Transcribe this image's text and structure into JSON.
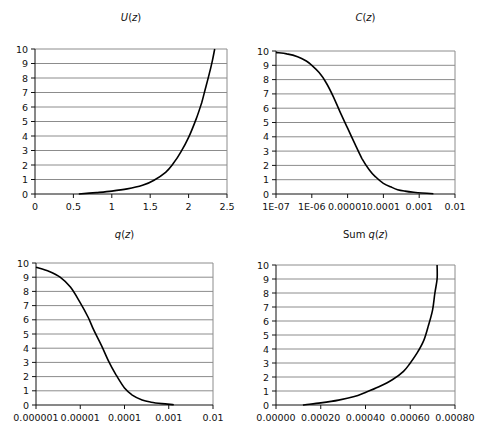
{
  "chart_data": [
    {
      "type": "line",
      "title": "U(z)",
      "title_parts": {
        "func": "U",
        "arg": "(z)"
      },
      "xlabel": "",
      "ylabel": "",
      "x_scale": "linear",
      "xlim": [
        0,
        2.5
      ],
      "ylim": [
        0,
        10
      ],
      "x_ticks": [
        "0",
        "0.5",
        "1",
        "1.5",
        "2",
        "2.5"
      ],
      "y_ticks": [
        "0",
        "1",
        "2",
        "3",
        "4",
        "5",
        "6",
        "7",
        "8",
        "9",
        "10"
      ],
      "grid": "horizontal",
      "legend": null,
      "series": [
        {
          "name": "U(z)",
          "x": [
            0.57,
            0.8,
            1.0,
            1.2,
            1.4,
            1.55,
            1.7,
            1.8,
            1.9,
            2.0,
            2.1,
            2.17,
            2.22,
            2.27,
            2.31,
            2.34
          ],
          "y": [
            0.0,
            0.1,
            0.2,
            0.35,
            0.6,
            0.95,
            1.5,
            2.1,
            2.9,
            3.9,
            5.2,
            6.3,
            7.3,
            8.3,
            9.2,
            10.0
          ]
        }
      ]
    },
    {
      "type": "line",
      "title": "C(z)",
      "title_parts": {
        "func": "C",
        "arg": "(z)"
      },
      "xlabel": "",
      "ylabel": "",
      "x_scale": "log",
      "xlim": [
        1e-07,
        0.01
      ],
      "ylim": [
        0,
        10
      ],
      "x_ticks": [
        "1E-07",
        "1E-06",
        "0.00001",
        "0.0001",
        "0.001",
        "0.01"
      ],
      "y_ticks": [
        "0",
        "1",
        "2",
        "3",
        "4",
        "5",
        "6",
        "7",
        "8",
        "9",
        "10"
      ],
      "grid": "horizontal",
      "legend": null,
      "series": [
        {
          "name": "C(z)",
          "x": [
            1e-07,
            2e-07,
            4e-07,
            7e-07,
            1e-06,
            1.6e-06,
            2.5e-06,
            4e-06,
            6e-06,
            1e-05,
            1.6e-05,
            2.5e-05,
            4e-05,
            6e-05,
            0.0001,
            0.00016,
            0.00025,
            0.0004,
            0.0007,
            0.0012,
            0.0025
          ],
          "y": [
            9.9,
            9.8,
            9.6,
            9.3,
            9.0,
            8.5,
            7.8,
            6.8,
            5.8,
            4.6,
            3.5,
            2.5,
            1.7,
            1.2,
            0.75,
            0.5,
            0.3,
            0.2,
            0.12,
            0.07,
            0.02
          ]
        }
      ]
    },
    {
      "type": "line",
      "title": "q(z)",
      "title_parts": {
        "func": "q",
        "arg": "(z)"
      },
      "xlabel": "",
      "ylabel": "",
      "x_scale": "log",
      "xlim": [
        1e-06,
        0.01
      ],
      "ylim": [
        0,
        10
      ],
      "x_ticks": [
        "0.000001",
        "0.00001",
        "0.0001",
        "0.001",
        "0.01"
      ],
      "y_ticks": [
        "0",
        "1",
        "2",
        "3",
        "4",
        "5",
        "6",
        "7",
        "8",
        "9",
        "10"
      ],
      "grid": "horizontal",
      "legend": null,
      "series": [
        {
          "name": "q(z)",
          "x": [
            1e-06,
            2e-06,
            3.5e-06,
            6e-06,
            1e-05,
            1.5e-05,
            2e-05,
            3e-05,
            4.5e-05,
            6.5e-05,
            0.0001,
            0.00015,
            0.00025,
            0.0004,
            0.0007,
            0.0013
          ],
          "y": [
            9.7,
            9.4,
            9.0,
            8.3,
            7.2,
            6.2,
            5.3,
            4.2,
            3.0,
            2.1,
            1.2,
            0.7,
            0.35,
            0.2,
            0.1,
            0.02
          ]
        }
      ]
    },
    {
      "type": "line",
      "title": "Sum q(z)",
      "title_parts": {
        "func": "Sum q",
        "arg": "(z)"
      },
      "xlabel": "",
      "ylabel": "",
      "x_scale": "linear",
      "xlim": [
        0,
        0.0008
      ],
      "ylim": [
        0,
        10
      ],
      "x_ticks": [
        "0.00000",
        "0.00020",
        "0.00040",
        "0.00060",
        "0.00080"
      ],
      "y_ticks": [
        "0",
        "1",
        "2",
        "3",
        "4",
        "5",
        "6",
        "7",
        "8",
        "9",
        "10"
      ],
      "grid": "horizontal",
      "legend": null,
      "series": [
        {
          "name": "Sum q(z)",
          "x": [
            0.00012,
            0.0002,
            0.00028,
            0.00035,
            0.0004,
            0.00046,
            0.00052,
            0.00057,
            0.0006,
            0.00063,
            0.00066,
            0.00068,
            0.0007,
            0.00071,
            0.00072,
            0.00072
          ],
          "y": [
            0.0,
            0.15,
            0.35,
            0.6,
            0.9,
            1.3,
            1.8,
            2.4,
            3.0,
            3.7,
            4.6,
            5.6,
            6.8,
            8.0,
            9.0,
            10.0
          ]
        }
      ]
    }
  ]
}
